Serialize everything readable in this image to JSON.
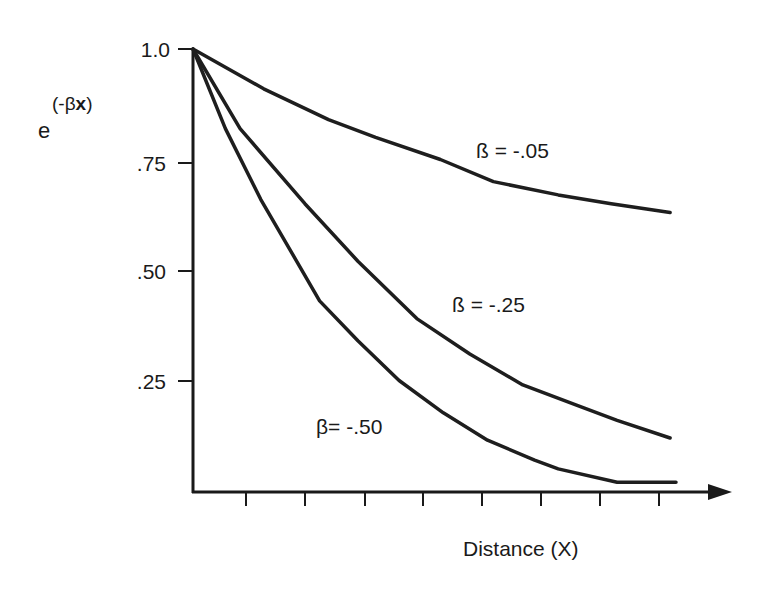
{
  "chart_data": {
    "type": "line",
    "title": "",
    "ylabel": "e^(-βx)",
    "ylabel_parts": {
      "base": "e",
      "superscript_prefix": "(-β",
      "superscript_var": "x",
      "superscript_suffix": ")"
    },
    "xlabel": "Distance (X)",
    "ylim": [
      0,
      1.0
    ],
    "xlim": [
      0,
      9
    ],
    "y_ticks": [
      {
        "value": 1.0,
        "label": "1.0"
      },
      {
        "value": 0.75,
        "label": ".75"
      },
      {
        "value": 0.5,
        "label": ".50"
      },
      {
        "value": 0.25,
        "label": ".25"
      }
    ],
    "x_ticks": [
      1,
      2,
      3,
      4,
      5,
      6,
      7,
      8
    ],
    "x_tick_labels_shown": false,
    "grid": false,
    "legend": "inline labels on curves",
    "series": [
      {
        "name": "ß = -.05",
        "beta": -0.05,
        "label_pos": {
          "x": 5.8,
          "y": 0.77
        },
        "points": [
          [
            0,
            1.0
          ],
          [
            1.2,
            0.91
          ],
          [
            2.3,
            0.84
          ],
          [
            3.1,
            0.8
          ],
          [
            4.2,
            0.75
          ],
          [
            5.1,
            0.7
          ],
          [
            6.2,
            0.67
          ],
          [
            7.1,
            0.65
          ],
          [
            8.1,
            0.63
          ]
        ]
      },
      {
        "name": "ß = -.25",
        "beta": -0.25,
        "label_pos": {
          "x": 5.3,
          "y": 0.4
        },
        "points": [
          [
            0,
            1.0
          ],
          [
            0.8,
            0.82
          ],
          [
            1.9,
            0.65
          ],
          [
            2.8,
            0.52
          ],
          [
            3.8,
            0.39
          ],
          [
            4.7,
            0.31
          ],
          [
            5.6,
            0.24
          ],
          [
            6.5,
            0.195
          ],
          [
            7.2,
            0.16
          ],
          [
            8.1,
            0.12
          ]
        ]
      },
      {
        "name": "β= -.50",
        "beta": -0.5,
        "label_pos": {
          "x": 2.0,
          "y": 0.13
        },
        "points": [
          [
            0,
            1.0
          ],
          [
            0.55,
            0.82
          ],
          [
            1.15,
            0.66
          ],
          [
            1.65,
            0.545
          ],
          [
            2.15,
            0.43
          ],
          [
            2.8,
            0.34
          ],
          [
            3.5,
            0.25
          ],
          [
            4.25,
            0.177
          ],
          [
            5.0,
            0.115
          ],
          [
            5.8,
            0.07
          ],
          [
            6.2,
            0.05
          ],
          [
            7.2,
            0.02
          ],
          [
            8.2,
            0.02
          ]
        ]
      }
    ]
  }
}
